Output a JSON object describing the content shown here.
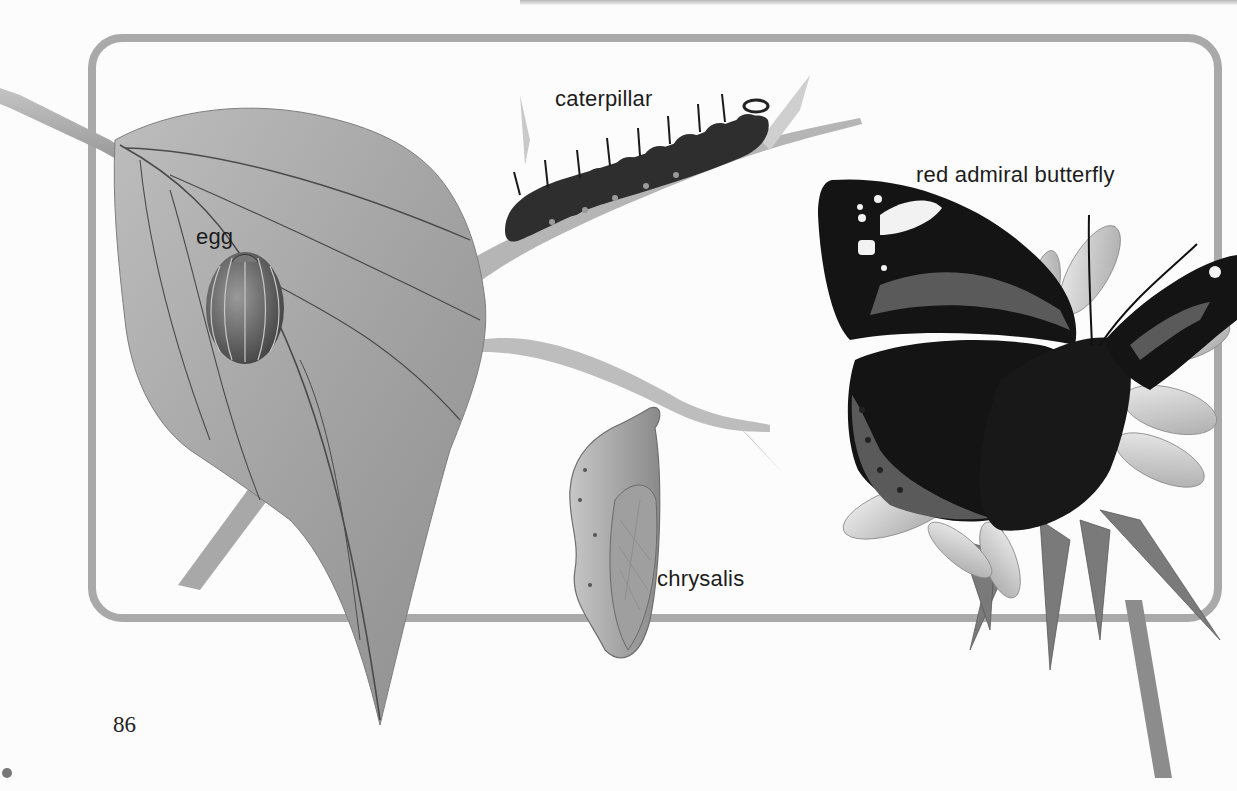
{
  "page": {
    "page_number": "86",
    "colors": {
      "background": "#fcfcfc",
      "frame": "#a9a9a9",
      "leaf": "#a3a3a3",
      "leaf_vein": "#4a4a4a",
      "caterpillar": "#2e2e2e",
      "butterfly_dark": "#141414",
      "butterfly_band": "#5a5a5a",
      "flower_petal": "#d8d8d8",
      "flower_leaf": "#7a7a7a",
      "text": "#1c1c1c"
    }
  },
  "illustration": {
    "title": "Life cycle of the red admiral butterfly",
    "labels": {
      "egg": "egg",
      "caterpillar": "caterpillar",
      "butterfly": "red admiral butterfly",
      "chrysalis": "chrysalis"
    },
    "stages": [
      {
        "id": "egg",
        "icon": "egg-icon"
      },
      {
        "id": "caterpillar",
        "icon": "caterpillar-icon"
      },
      {
        "id": "chrysalis",
        "icon": "chrysalis-icon"
      },
      {
        "id": "butterfly",
        "icon": "butterfly-icon"
      }
    ]
  }
}
